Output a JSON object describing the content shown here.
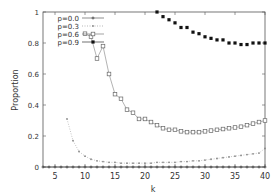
{
  "chart_data": {
    "type": "line",
    "title": "",
    "xlabel": "k",
    "ylabel": "Proportion",
    "xlim": [
      3,
      40
    ],
    "ylim": [
      0,
      1
    ],
    "xticks": [
      5,
      10,
      15,
      20,
      25,
      30,
      35,
      40
    ],
    "yticks": [
      0,
      0.2,
      0.4,
      0.6,
      0.8,
      1
    ],
    "ytick_labels": [
      "0",
      "0.2",
      "0.4",
      "0.6",
      "0.8",
      "1"
    ],
    "grid": false,
    "legend_position": "top-left",
    "series": [
      {
        "name": "p=0.0",
        "marker": "plus",
        "x": [
          3,
          4,
          5,
          6,
          7,
          8,
          9,
          10,
          11,
          12,
          13,
          14,
          15,
          16,
          17,
          18,
          19,
          20,
          21,
          22,
          23,
          24,
          25,
          26,
          27,
          28,
          29,
          30,
          31,
          32,
          33,
          34,
          35,
          36,
          37,
          38,
          39,
          40
        ],
        "values": [
          0,
          0,
          0,
          0,
          0,
          0,
          0,
          0,
          0,
          0,
          0,
          0,
          0,
          0,
          0,
          0,
          0,
          0,
          0,
          0,
          0,
          0,
          0,
          0,
          0,
          0,
          0,
          0,
          0,
          0,
          0,
          0,
          0,
          0,
          0,
          0,
          0,
          0
        ]
      },
      {
        "name": "p=0.3",
        "marker": "dot",
        "x": [
          7,
          8,
          9,
          10,
          11,
          12,
          13,
          14,
          15,
          16,
          17,
          18,
          19,
          20,
          21,
          22,
          23,
          24,
          25,
          26,
          27,
          28,
          29,
          30,
          31,
          32,
          33,
          34,
          35,
          36,
          37,
          38,
          39,
          40
        ],
        "values": [
          0.31,
          0.17,
          0.1,
          0.07,
          0.05,
          0.04,
          0.035,
          0.03,
          0.03,
          0.025,
          0.025,
          0.025,
          0.025,
          0.025,
          0.025,
          0.03,
          0.03,
          0.03,
          0.03,
          0.035,
          0.035,
          0.04,
          0.04,
          0.045,
          0.05,
          0.055,
          0.06,
          0.065,
          0.07,
          0.075,
          0.08,
          0.085,
          0.09,
          0.12
        ]
      },
      {
        "name": "p=0.6",
        "marker": "square-open",
        "x": [
          10,
          11,
          12,
          13,
          14,
          15,
          16,
          17,
          18,
          19,
          20,
          21,
          22,
          23,
          24,
          25,
          26,
          27,
          28,
          29,
          30,
          31,
          32,
          33,
          34,
          35,
          36,
          37,
          38,
          39,
          40
        ],
        "values": [
          0.86,
          0.84,
          0.7,
          0.78,
          0.6,
          0.47,
          0.44,
          0.37,
          0.35,
          0.31,
          0.31,
          0.29,
          0.27,
          0.25,
          0.24,
          0.24,
          0.23,
          0.225,
          0.225,
          0.225,
          0.23,
          0.235,
          0.24,
          0.245,
          0.25,
          0.255,
          0.26,
          0.27,
          0.28,
          0.29,
          0.3
        ]
      },
      {
        "name": "p=0.9",
        "marker": "square-filled",
        "x": [
          22,
          23,
          24,
          25,
          26,
          27,
          28,
          29,
          30,
          31,
          32,
          33,
          34,
          35,
          36,
          37,
          38,
          39,
          40
        ],
        "values": [
          1.0,
          0.97,
          0.95,
          0.93,
          0.9,
          0.9,
          0.87,
          0.86,
          0.84,
          0.83,
          0.82,
          0.82,
          0.8,
          0.8,
          0.79,
          0.79,
          0.8,
          0.8,
          0.8
        ]
      }
    ]
  },
  "colors": {
    "axis": "#555555",
    "p00": "#444444",
    "p03": "#888888",
    "p06": "#666666",
    "p09": "#111111"
  }
}
